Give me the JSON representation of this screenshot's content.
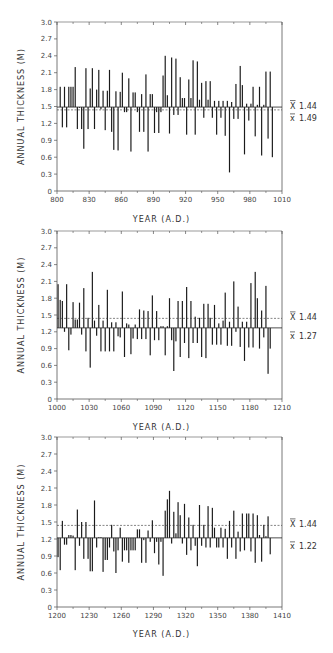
{
  "chart_data": [
    {
      "type": "bar",
      "title": "",
      "xlabel": "YEAR (A.D.)",
      "ylabel": "ANNUAL THICKNESS (M)",
      "xlim": [
        800,
        1010
      ],
      "ylim": [
        0,
        3.0
      ],
      "x_ticks": [
        "800",
        "830",
        "860",
        "890",
        "920",
        "950",
        "980",
        "1010"
      ],
      "y_ticks": [
        "0",
        "0.3",
        "0.6",
        "0.9",
        "1.2",
        "1.5",
        "1.8",
        "2.1",
        "2.4",
        "2.7",
        "3.0"
      ],
      "grid": false,
      "reference_lines": [
        {
          "name": "overall_mean",
          "symbol": "X̄",
          "value": 1.44,
          "style": "dashed"
        },
        {
          "name": "period_mean",
          "symbol": "x̄",
          "value": 1.49,
          "style": "solid"
        }
      ],
      "baseline": 1.49,
      "x": [
        803,
        805,
        807,
        809,
        811,
        813,
        815,
        817,
        819,
        821,
        823,
        825,
        827,
        829,
        831,
        833,
        835,
        837,
        839,
        841,
        843,
        845,
        847,
        849,
        851,
        853,
        855,
        857,
        859,
        861,
        863,
        865,
        867,
        869,
        871,
        873,
        875,
        877,
        879,
        881,
        883,
        885,
        887,
        889,
        891,
        893,
        895,
        897,
        899,
        901,
        903,
        905,
        907,
        909,
        911,
        913,
        915,
        917,
        919,
        921,
        923,
        925,
        927,
        929,
        931,
        933,
        935,
        937,
        939,
        941,
        943,
        945,
        947,
        949,
        951,
        953,
        955,
        957,
        959,
        961,
        963,
        965,
        967,
        969,
        971,
        973,
        975,
        977,
        979,
        981,
        983,
        985,
        987,
        989,
        991,
        993,
        995,
        997,
        999,
        1001
      ],
      "values": [
        1.85,
        1.13,
        1.85,
        1.13,
        1.85,
        1.85,
        1.85,
        2.2,
        1.1,
        1.48,
        1.1,
        0.75,
        2.18,
        1.1,
        1.82,
        2.18,
        1.1,
        1.8,
        2.15,
        1.45,
        1.78,
        1.08,
        1.78,
        2.15,
        1.05,
        0.73,
        1.77,
        0.72,
        1.76,
        2.1,
        1.4,
        1.4,
        2.0,
        0.7,
        1.75,
        1.75,
        1.4,
        1.05,
        1.72,
        1.05,
        2.07,
        0.7,
        1.72,
        1.72,
        1.03,
        1.4,
        1.03,
        1.4,
        2.05,
        2.4,
        1.7,
        1.02,
        2.37,
        1.35,
        2.35,
        1.35,
        2.02,
        1.65,
        1.65,
        1.0,
        1.98,
        1.65,
        2.32,
        1.0,
        2.3,
        1.62,
        1.92,
        1.3,
        1.95,
        1.62,
        1.95,
        1.3,
        1.6,
        1.0,
        1.6,
        1.3,
        1.6,
        0.98,
        1.6,
        0.33,
        1.58,
        1.28,
        1.9,
        1.28,
        2.22,
        1.88,
        0.65,
        1.55,
        1.25,
        1.55,
        1.85,
        0.97,
        1.53,
        1.85,
        0.63,
        1.53,
        2.12,
        0.93,
        2.12,
        0.6
      ]
    },
    {
      "type": "bar",
      "title": "",
      "xlabel": "YEAR (A.D.)",
      "ylabel": "ANNUAL THICKNESS (M)",
      "xlim": [
        1000,
        1210
      ],
      "ylim": [
        0,
        3.0
      ],
      "x_ticks": [
        "1000",
        "1030",
        "1060",
        "1090",
        "1120",
        "1150",
        "1180",
        "1210"
      ],
      "y_ticks": [
        "0",
        "0.3",
        "0.6",
        "0.9",
        "1.2",
        "1.5",
        "1.8",
        "2.1",
        "2.4",
        "2.7",
        "3.0"
      ],
      "grid": false,
      "reference_lines": [
        {
          "name": "overall_mean",
          "symbol": "X̄",
          "value": 1.44,
          "style": "dashed"
        },
        {
          "name": "period_mean",
          "symbol": "x̄",
          "value": 1.27,
          "style": "solid"
        }
      ],
      "baseline": 1.27,
      "x": [
        1001,
        1003,
        1005,
        1007,
        1009,
        1011,
        1013,
        1015,
        1017,
        1019,
        1021,
        1023,
        1025,
        1027,
        1029,
        1031,
        1033,
        1035,
        1037,
        1039,
        1041,
        1043,
        1045,
        1047,
        1049,
        1051,
        1053,
        1055,
        1057,
        1059,
        1061,
        1063,
        1065,
        1067,
        1069,
        1071,
        1073,
        1075,
        1077,
        1079,
        1081,
        1083,
        1085,
        1087,
        1089,
        1091,
        1093,
        1095,
        1097,
        1099,
        1101,
        1103,
        1105,
        1107,
        1109,
        1111,
        1113,
        1115,
        1117,
        1119,
        1121,
        1123,
        1125,
        1127,
        1129,
        1131,
        1133,
        1135,
        1137,
        1139,
        1141,
        1143,
        1145,
        1147,
        1149,
        1151,
        1153,
        1155,
        1157,
        1159,
        1161,
        1163,
        1165,
        1167,
        1169,
        1171,
        1173,
        1175,
        1177,
        1179,
        1181,
        1183,
        1185,
        1187,
        1189,
        1191,
        1193,
        1195,
        1197,
        1199
      ],
      "values": [
        2.05,
        1.77,
        1.75,
        1.2,
        2.05,
        0.87,
        1.15,
        1.73,
        1.42,
        1.42,
        1.72,
        1.15,
        1.98,
        0.85,
        1.45,
        0.56,
        2.27,
        1.4,
        1.13,
        1.68,
        0.85,
        1.4,
        0.85,
        1.95,
        0.85,
        1.37,
        0.85,
        1.37,
        1.12,
        1.1,
        1.92,
        0.75,
        1.35,
        1.33,
        0.8,
        1.08,
        1.33,
        1.07,
        1.6,
        1.07,
        1.58,
        1.07,
        1.57,
        0.78,
        1.85,
        1.05,
        1.57,
        1.05,
        1.3,
        1.3,
        0.78,
        1.3,
        1.8,
        1.05,
        0.5,
        1.03,
        1.75,
        0.75,
        1.75,
        1.0,
        2.0,
        0.73,
        1.75,
        1.0,
        1.47,
        1.0,
        1.45,
        0.75,
        1.7,
        0.73,
        1.7,
        1.45,
        0.97,
        1.68,
        0.97,
        1.35,
        0.97,
        1.4,
        1.9,
        0.95,
        1.38,
        0.95,
        2.1,
        1.2,
        1.65,
        0.93,
        1.38,
        0.68,
        1.38,
        0.92,
        2.07,
        0.92,
        2.27,
        1.8,
        0.9,
        1.58,
        1.1,
        2.02,
        0.45,
        0.9
      ]
    },
    {
      "type": "bar",
      "title": "",
      "xlabel": "YEAR (A.D.)",
      "ylabel": "ANNUAL THICKNESS (M)",
      "xlim": [
        1200,
        1410
      ],
      "ylim": [
        0,
        3.0
      ],
      "x_ticks": [
        "1200",
        "1230",
        "1260",
        "1290",
        "1320",
        "1350",
        "1380",
        "1410"
      ],
      "y_ticks": [
        "0",
        "0.3",
        "0.6",
        "0.9",
        "1.2",
        "1.5",
        "1.8",
        "2.1",
        "2.4",
        "2.7",
        "3.0"
      ],
      "grid": false,
      "reference_lines": [
        {
          "name": "overall_mean",
          "symbol": "X̄",
          "value": 1.44,
          "style": "dashed"
        },
        {
          "name": "period_mean",
          "symbol": "x̄",
          "value": 1.22,
          "style": "solid"
        }
      ],
      "baseline": 1.22,
      "x": [
        1201,
        1203,
        1205,
        1207,
        1209,
        1211,
        1213,
        1215,
        1217,
        1219,
        1221,
        1223,
        1225,
        1227,
        1229,
        1231,
        1233,
        1235,
        1237,
        1239,
        1241,
        1243,
        1245,
        1247,
        1249,
        1251,
        1253,
        1255,
        1257,
        1259,
        1261,
        1263,
        1265,
        1267,
        1269,
        1271,
        1273,
        1275,
        1277,
        1279,
        1281,
        1283,
        1285,
        1287,
        1289,
        1291,
        1293,
        1295,
        1297,
        1299,
        1301,
        1303,
        1305,
        1307,
        1309,
        1311,
        1313,
        1315,
        1317,
        1319,
        1321,
        1323,
        1325,
        1327,
        1329,
        1331,
        1333,
        1335,
        1337,
        1339,
        1341,
        1343,
        1345,
        1347,
        1349,
        1351,
        1353,
        1355,
        1357,
        1359,
        1361,
        1363,
        1365,
        1367,
        1369,
        1371,
        1373,
        1375,
        1377,
        1379,
        1381,
        1383,
        1385,
        1387,
        1389,
        1391,
        1393,
        1395,
        1397,
        1399
      ],
      "values": [
        0.88,
        0.65,
        1.52,
        1.1,
        1.1,
        1.27,
        1.27,
        1.26,
        0.65,
        1.72,
        1.08,
        1.5,
        0.85,
        1.5,
        0.85,
        0.63,
        0.63,
        1.88,
        1.05,
        1.23,
        1.23,
        0.62,
        0.83,
        0.83,
        1.05,
        1.45,
        0.98,
        0.6,
        1.0,
        1.4,
        0.8,
        1.0,
        1.0,
        0.78,
        1.0,
        1.0,
        1.0,
        1.37,
        1.37,
        0.78,
        1.18,
        0.78,
        1.35,
        1.15,
        1.53,
        0.95,
        1.15,
        0.75,
        1.15,
        0.55,
        1.7,
        1.9,
        2.05,
        1.12,
        1.68,
        1.3,
        1.85,
        1.62,
        1.12,
        1.82,
        0.92,
        1.58,
        1.0,
        1.45,
        1.08,
        0.72,
        1.8,
        1.08,
        1.45,
        1.05,
        1.78,
        1.05,
        1.75,
        1.4,
        1.05,
        1.05,
        1.4,
        1.05,
        1.38,
        0.85,
        1.52,
        1.05,
        1.7,
        0.85,
        1.33,
        0.98,
        1.65,
        1.0,
        1.65,
        1.65,
        0.98,
        1.65,
        0.78,
        1.62,
        1.27,
        0.8,
        1.45,
        1.25,
        1.6,
        0.93
      ]
    }
  ],
  "figure": {
    "axis_color": "#555555",
    "bar_color": "#1a1a1a",
    "background": "#ffffff"
  },
  "plots": [
    {
      "xlabel": "YEAR (A.D.)",
      "ylabel": "ANNUAL THICKNESS (M)",
      "overall_mean_label": "1.44",
      "period_mean_label": "1.49"
    },
    {
      "xlabel": "YEAR (A.D.)",
      "ylabel": "ANNUAL THICKNESS (M)",
      "overall_mean_label": "1.44",
      "period_mean_label": "1.27"
    },
    {
      "xlabel": "YEAR (A.D.)",
      "ylabel": "ANNUAL THICKNESS (M)",
      "overall_mean_label": "1.44",
      "period_mean_label": "1.22"
    }
  ]
}
